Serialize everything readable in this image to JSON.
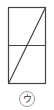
{
  "diagram": {
    "shape": "rectangle-divided",
    "rect": {
      "x": 8,
      "y": 7,
      "width": 37,
      "height": 76
    },
    "midline_y": 45,
    "diagonal": {
      "from": [
        8,
        83
      ],
      "to": [
        45,
        7
      ]
    },
    "stroke_color": "#444444",
    "label": "ウ"
  }
}
